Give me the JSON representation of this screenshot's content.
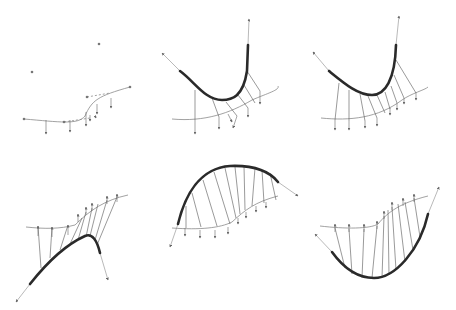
{
  "figure": {
    "layout": {
      "rows": 2,
      "cols": 3,
      "panel_w": 152,
      "panel_h": 155
    },
    "colors": {
      "thick_curve": "#2a2a2a",
      "thin_curve": "#8a8a8a",
      "projection": "#555555",
      "arrow": "#666666",
      "point": "#777777"
    },
    "panels": [
      {
        "id": "a",
        "thick": "",
        "thin": "M24,119 C60,122 78,125 85,116 C92,100 98,96 130,87",
        "tangents": [],
        "dashed": "M64,122 L90,118 M87,97 L110,93",
        "points": [
          [
            32,
            72
          ],
          [
            99,
            44
          ],
          [
            87,
            97
          ],
          [
            24,
            119
          ],
          [
            64,
            122
          ],
          [
            130,
            87
          ]
        ],
        "projections": [],
        "arrows": [
          [
            46,
            120,
            46,
            134
          ],
          [
            70,
            120,
            70,
            132
          ],
          [
            86,
            112,
            86,
            126
          ],
          [
            97,
            104,
            97,
            114
          ],
          [
            111,
            98,
            111,
            108
          ],
          [
            90,
            115,
            90,
            121
          ],
          [
            95,
            116,
            96,
            118
          ]
        ]
      },
      {
        "id": "b",
        "thick": "M180,71 C195,82 205,100 222,100 C232,100 243,97 247,71 L248,45",
        "thin": "M172,119 C205,122 230,113 252,100 C268,93 280,90 278,86",
        "tangents": [
          [
            180,
            71,
            162,
            53
          ],
          [
            248,
            45,
            249,
            19
          ]
        ],
        "dashed": "",
        "points": [],
        "projections": [
          [
            195,
            90,
            195,
            120
          ],
          [
            212,
            98,
            219,
            117
          ],
          [
            226,
            102,
            237,
            116
          ],
          [
            238,
            95,
            248,
            108
          ],
          [
            247,
            71,
            260,
            91
          ],
          [
            244,
            85,
            255,
            103
          ]
        ],
        "arrows": [
          [
            195,
            120,
            195,
            134
          ],
          [
            219,
            117,
            219,
            129
          ],
          [
            237,
            116,
            233,
            128
          ],
          [
            248,
            108,
            248,
            117
          ],
          [
            260,
            91,
            260,
            104
          ],
          [
            228,
            114,
            232,
            122
          ]
        ]
      },
      {
        "id": "c",
        "thick": "M329,71 C345,84 358,95 372,95 C385,95 395,80 396,45",
        "thin": "M321,118 C350,121 378,118 402,100 C412,93 425,90 428,87",
        "tangents": [
          [
            329,
            71,
            313,
            52
          ],
          [
            396,
            45,
            399,
            16
          ]
        ],
        "dashed": "",
        "points": [],
        "projections": [
          [
            339,
            83,
            335,
            120
          ],
          [
            349,
            90,
            349,
            121
          ],
          [
            360,
            94,
            365,
            121
          ],
          [
            368,
            96,
            377,
            118
          ],
          [
            377,
            95,
            385,
            113
          ],
          [
            385,
            92,
            390,
            109
          ],
          [
            391,
            86,
            397,
            103
          ],
          [
            394,
            75,
            404,
            98
          ],
          [
            396,
            60,
            416,
            93
          ]
        ],
        "arrows": [
          [
            335,
            120,
            335,
            130
          ],
          [
            349,
            121,
            349,
            130
          ],
          [
            365,
            121,
            365,
            128
          ],
          [
            377,
            118,
            377,
            126
          ],
          [
            390,
            108,
            390,
            115
          ],
          [
            397,
            103,
            397,
            110
          ],
          [
            404,
            98,
            404,
            104
          ],
          [
            416,
            93,
            416,
            100
          ]
        ]
      },
      {
        "id": "d",
        "thick": "M30,284 C45,265 65,245 85,236 C92,233 97,240 100,253",
        "thin": "M26,227 C45,229 60,229 75,225 C90,210 105,200 128,195",
        "tangents": [
          [
            30,
            284,
            16,
            302
          ],
          [
            100,
            253,
            108,
            280
          ]
        ],
        "dashed": "",
        "points": [],
        "projections": [
          [
            41,
            268,
            38,
            226
          ],
          [
            50,
            258,
            52,
            227
          ],
          [
            60,
            250,
            68,
            225
          ],
          [
            70,
            244,
            82,
            218
          ],
          [
            78,
            240,
            86,
            212
          ],
          [
            86,
            237,
            92,
            208
          ],
          [
            90,
            236,
            98,
            204
          ],
          [
            95,
            240,
            107,
            200
          ],
          [
            97,
            245,
            117,
            197
          ]
        ],
        "arrows": [
          [
            38,
            236,
            38,
            226
          ],
          [
            52,
            237,
            52,
            227
          ],
          [
            68,
            235,
            68,
            225
          ],
          [
            78,
            222,
            78,
            214
          ],
          [
            86,
            215,
            86,
            207
          ],
          [
            92,
            211,
            92,
            203
          ],
          [
            107,
            204,
            107,
            196
          ],
          [
            117,
            202,
            117,
            194
          ]
        ]
      },
      {
        "id": "e",
        "thick": "M178,224 C185,195 200,168 230,166 C255,165 270,172 278,182",
        "thin": "M172,228 C200,230 220,228 232,222 C245,210 255,202 278,196",
        "tangents": [
          [
            178,
            224,
            170,
            247
          ],
          [
            278,
            182,
            298,
            196
          ]
        ],
        "dashed": "",
        "points": [],
        "projections": [
          [
            186,
            206,
            186,
            228
          ],
          [
            192,
            193,
            201,
            227
          ],
          [
            203,
            180,
            217,
            226
          ],
          [
            214,
            172,
            230,
            224
          ],
          [
            225,
            168,
            236,
            218
          ],
          [
            235,
            167,
            240,
            214
          ],
          [
            244,
            166,
            245,
            210
          ],
          [
            255,
            168,
            252,
            206
          ],
          [
            262,
            170,
            264,
            203
          ],
          [
            270,
            173,
            276,
            200
          ]
        ],
        "arrows": [
          [
            185,
            228,
            185,
            236
          ],
          [
            200,
            230,
            200,
            238
          ],
          [
            215,
            230,
            215,
            238
          ],
          [
            228,
            227,
            228,
            234
          ],
          [
            238,
            218,
            238,
            224
          ],
          [
            246,
            212,
            246,
            218
          ],
          [
            256,
            206,
            256,
            212
          ],
          [
            266,
            202,
            266,
            208
          ]
        ]
      },
      {
        "id": "f",
        "thick": "M332,252 C345,270 360,278 374,278 C395,278 420,250 428,214",
        "thin": "M320,226 C345,229 370,229 378,224 C388,212 400,203 428,196",
        "tangents": [
          [
            332,
            252,
            315,
            234
          ],
          [
            428,
            214,
            439,
            187
          ]
        ],
        "dashed": "",
        "points": [],
        "projections": [
          [
            335,
            228,
            345,
            268
          ],
          [
            349,
            229,
            352,
            274
          ],
          [
            364,
            229,
            362,
            278
          ],
          [
            377,
            226,
            372,
            278
          ],
          [
            384,
            216,
            382,
            278
          ],
          [
            388,
            210,
            389,
            275
          ],
          [
            392,
            207,
            396,
            270
          ],
          [
            398,
            204,
            405,
            262
          ],
          [
            405,
            202,
            413,
            250
          ],
          [
            414,
            198,
            420,
            237
          ]
        ],
        "arrows": [
          [
            335,
            232,
            335,
            224
          ],
          [
            349,
            232,
            349,
            224
          ],
          [
            364,
            232,
            364,
            224
          ],
          [
            377,
            229,
            377,
            221
          ],
          [
            384,
            219,
            384,
            211
          ],
          [
            392,
            210,
            392,
            202
          ],
          [
            403,
            206,
            403,
            198
          ],
          [
            414,
            202,
            414,
            194
          ]
        ]
      }
    ]
  }
}
